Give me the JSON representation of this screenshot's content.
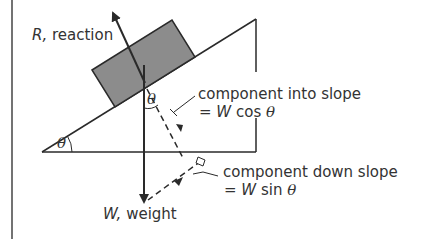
{
  "diagram": {
    "colors": {
      "line": "#2a2a2a",
      "block_fill": "#8c8c8c",
      "text": "#333333",
      "background": "#ffffff"
    },
    "labels": {
      "reaction_symbol": "R,",
      "reaction_text": " reaction",
      "weight_symbol": "W,",
      "weight_text": " weight",
      "component_into_slope": "component into slope",
      "component_into_slope_eq_prefix": "= ",
      "component_into_slope_eq_symbol": "W",
      "component_into_slope_eq_func": " cos ",
      "component_down_slope": "component down slope",
      "component_down_slope_eq_prefix": "= ",
      "component_down_slope_eq_symbol": "W",
      "component_down_slope_eq_func": " sin ",
      "theta": "θ",
      "angle_base": "θ",
      "angle_weight": "θ"
    }
  }
}
